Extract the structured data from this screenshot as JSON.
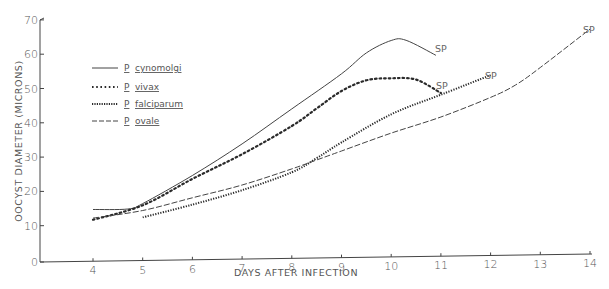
{
  "chart_data": {
    "type": "line",
    "title": "",
    "xlabel": "DAYS AFTER INFECTION",
    "ylabel": "OOCYST DIAMETER (MICRONS)",
    "xlim": [
      3,
      14
    ],
    "ylim": [
      0,
      70
    ],
    "x_ticks": [
      4,
      5,
      6,
      7,
      8,
      9,
      10,
      11,
      12,
      13,
      14
    ],
    "y_ticks": [
      0,
      10,
      20,
      30,
      40,
      50,
      60,
      70
    ],
    "grid": false,
    "legend_position": "upper-left",
    "series": [
      {
        "name": "P. cynomolgi",
        "genus": "P",
        "species": "cynomolgi",
        "style": "solid",
        "x": [
          4,
          4.7,
          5,
          6,
          7,
          8,
          9,
          9.5,
          10,
          10.3,
          10.9
        ],
        "y": [
          14.5,
          14.5,
          16,
          24,
          33,
          43,
          53,
          59,
          62.5,
          62.5,
          58
        ],
        "end_annotation": "SP"
      },
      {
        "name": "P. vivax",
        "genus": "P",
        "species": "vivax",
        "style": "dotted",
        "x": [
          4,
          5,
          6,
          7,
          8,
          8.5,
          9,
          9.5,
          10,
          10.5,
          11
        ],
        "y": [
          11.5,
          15.5,
          23,
          30,
          38,
          43,
          48,
          51,
          51.5,
          51,
          47
        ],
        "end_annotation": "SP"
      },
      {
        "name": "P. falciparum",
        "genus": "P",
        "species": "falciparum",
        "style": "dense-dotted",
        "x": [
          5,
          6,
          7,
          8,
          8.5,
          9,
          10,
          11,
          12
        ],
        "y": [
          12,
          15.5,
          19.5,
          24.5,
          28.5,
          33,
          41,
          46.5,
          52
        ],
        "end_annotation": "SP"
      },
      {
        "name": "P. ovale",
        "genus": "P",
        "species": "ovale",
        "style": "dashed",
        "x": [
          4,
          5,
          6,
          7,
          8,
          8.5,
          9,
          10,
          11,
          12,
          12.5,
          13,
          14
        ],
        "y": [
          12,
          14,
          17.5,
          21,
          25.5,
          28,
          30.5,
          35.5,
          40,
          45.5,
          49,
          54,
          65
        ],
        "end_annotation": "SP"
      }
    ],
    "annotations": [
      "SP",
      "SP",
      "SP",
      "SP"
    ]
  },
  "axes": {
    "x_title": "DAYS AFTER INFECTION",
    "y_title": "OOCYST DIAMETER (MICRONS)",
    "x_tick_labels": [
      "4",
      "5",
      "6",
      "7",
      "8",
      "9",
      "10",
      "11",
      "12",
      "13",
      "14"
    ],
    "y_tick_labels": [
      "0",
      "10",
      "20",
      "30",
      "40",
      "50",
      "60",
      "70"
    ]
  },
  "legend": [
    {
      "genus": "P",
      "species": "cynomolgi"
    },
    {
      "genus": "P",
      "species": "vivax"
    },
    {
      "genus": "P",
      "species": "falciparum"
    },
    {
      "genus": "P",
      "species": "ovale"
    }
  ],
  "end_label": "SP",
  "colors": {
    "line": "#3a3a3a",
    "text": "#555555",
    "background": "#ffffff"
  }
}
